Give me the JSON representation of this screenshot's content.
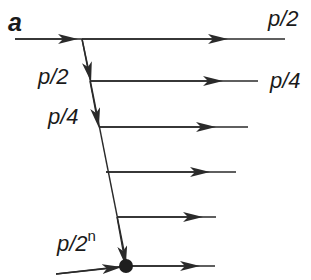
{
  "diagram": {
    "colors": {
      "line": "#2a2a2a",
      "text": "#1a1a1a",
      "background": "#ffffff"
    },
    "labels": {
      "a": "a",
      "top_right": "p/2",
      "branch1_right": "p/4",
      "diag1": "p/2",
      "diag2": "p/4",
      "diag_last_base": "p/2",
      "diag_last_exp": "n"
    },
    "elements": [
      "incoming beam a splitting at vertex",
      "diagonal chain of splits with amplitudes p/2, p/4, ..., p/2^n",
      "horizontal output beams with arrows",
      "final node (filled dot) with incoming and outgoing beam"
    ]
  }
}
